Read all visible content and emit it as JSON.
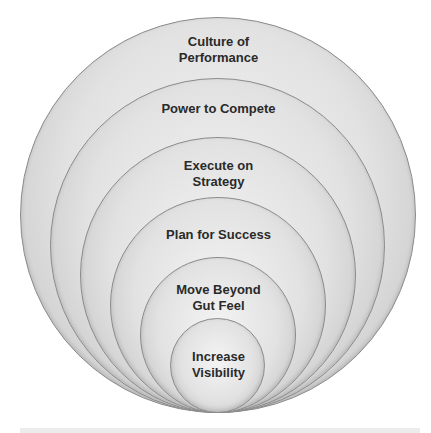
{
  "diagram": {
    "type": "nested-circles",
    "layers": [
      {
        "label_line1": "Culture of",
        "label_line2": "Performance"
      },
      {
        "label_line1": "Power to Compete",
        "label_line2": ""
      },
      {
        "label_line1": "Execute on",
        "label_line2": "Strategy"
      },
      {
        "label_line1": "Plan for Success",
        "label_line2": ""
      },
      {
        "label_line1": "Move Beyond",
        "label_line2": "Gut Feel"
      },
      {
        "label_line1": "Increase",
        "label_line2": "Visibility"
      }
    ]
  }
}
